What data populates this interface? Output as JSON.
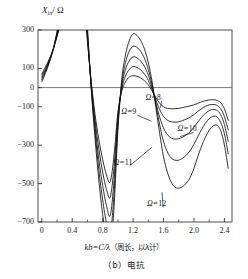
{
  "figure": {
    "caption": "（b）电抗",
    "y_axis_title": "X",
    "y_axis_sub": "in",
    "y_axis_unit": "/ Ω",
    "x_axis_title_math": "kb=C/λ",
    "x_axis_title_cn": "（周长，以λ计）"
  },
  "chart_data": {
    "type": "line",
    "title": "（b）电抗",
    "xlabel": "kb=C/λ （周长，以λ计）",
    "ylabel": "X_in / Ω",
    "xlim": [
      -0.05,
      2.5
    ],
    "ylim": [
      -700,
      300
    ],
    "xticks": [
      0,
      0.4,
      0.8,
      1.2,
      1.6,
      2.0,
      2.4
    ],
    "xtick_labels": [
      "0",
      "0.4",
      "0.8",
      "1.2",
      "1.6",
      "2.0",
      "2.4"
    ],
    "yticks": [
      300,
      100,
      0,
      -100,
      -300,
      -500,
      -700
    ],
    "ytick_labels": [
      "300",
      "100",
      "0",
      "-100",
      "-300",
      "-500",
      "-700"
    ],
    "grid": false,
    "zero_line": true,
    "legend_position": "inline-annotations",
    "series": [
      {
        "name": "Ω=8",
        "label": "Ω=8",
        "label_value": "8",
        "x": [
          0.0,
          0.05,
          0.1,
          0.15,
          0.2,
          0.25,
          0.3,
          0.35,
          0.4,
          0.45,
          0.5,
          0.55,
          0.6,
          0.65,
          0.7,
          0.75,
          0.8,
          0.85,
          0.9,
          0.95,
          1.0,
          1.05,
          1.1,
          1.15,
          1.2,
          1.25,
          1.3,
          1.35,
          1.4,
          1.45,
          1.5,
          1.55,
          1.6,
          1.65,
          1.7,
          1.75,
          1.8,
          1.85,
          1.9,
          1.95,
          2.0,
          2.05,
          2.1,
          2.15,
          2.2,
          2.25,
          2.3,
          2.35,
          2.4,
          2.45
        ],
        "y": [
          70,
          110,
          150,
          200,
          265,
          340,
          430,
          540,
          660,
          760,
          700,
          480,
          240,
          30,
          -140,
          -270,
          -375,
          -455,
          -490,
          -350,
          -130,
          -20,
          30,
          55,
          62,
          60,
          50,
          36,
          14,
          -18,
          -52,
          -82,
          -100,
          -108,
          -110,
          -110,
          -108,
          -104,
          -100,
          -95,
          -90,
          -82,
          -74,
          -68,
          -64,
          -63,
          -66,
          -78,
          -110,
          -170
        ]
      },
      {
        "name": "Ω=9",
        "label": "Ω=9",
        "label_value": "9",
        "x": [
          0.0,
          0.05,
          0.1,
          0.15,
          0.2,
          0.25,
          0.3,
          0.35,
          0.4,
          0.45,
          0.5,
          0.55,
          0.6,
          0.65,
          0.7,
          0.75,
          0.8,
          0.85,
          0.9,
          0.95,
          1.0,
          1.05,
          1.1,
          1.15,
          1.2,
          1.25,
          1.3,
          1.35,
          1.4,
          1.45,
          1.5,
          1.55,
          1.6,
          1.65,
          1.7,
          1.75,
          1.8,
          1.85,
          1.9,
          1.95,
          2.0,
          2.05,
          2.1,
          2.15,
          2.2,
          2.25,
          2.3,
          2.35,
          2.4,
          2.45
        ],
        "y": [
          60,
          100,
          145,
          200,
          270,
          355,
          455,
          580,
          720,
          830,
          760,
          520,
          255,
          20,
          -170,
          -320,
          -440,
          -530,
          -570,
          -410,
          -150,
          -10,
          60,
          95,
          110,
          105,
          92,
          70,
          38,
          -10,
          -65,
          -115,
          -150,
          -170,
          -178,
          -180,
          -178,
          -172,
          -164,
          -154,
          -140,
          -124,
          -110,
          -98,
          -90,
          -88,
          -92,
          -110,
          -150,
          -220
        ]
      },
      {
        "name": "Ω=10",
        "label": "Ω=10",
        "label_value": "10",
        "x": [
          0.0,
          0.05,
          0.1,
          0.15,
          0.2,
          0.25,
          0.3,
          0.35,
          0.4,
          0.45,
          0.5,
          0.55,
          0.6,
          0.65,
          0.7,
          0.75,
          0.8,
          0.85,
          0.9,
          0.95,
          1.0,
          1.05,
          1.1,
          1.15,
          1.2,
          1.25,
          1.3,
          1.35,
          1.4,
          1.45,
          1.5,
          1.55,
          1.6,
          1.65,
          1.7,
          1.75,
          1.8,
          1.85,
          1.9,
          1.95,
          2.0,
          2.05,
          2.1,
          2.15,
          2.2,
          2.25,
          2.3,
          2.35,
          2.4,
          2.45
        ],
        "y": [
          50,
          92,
          140,
          200,
          278,
          372,
          485,
          625,
          790,
          910,
          835,
          570,
          275,
          10,
          -200,
          -375,
          -510,
          -615,
          -665,
          -480,
          -175,
          5,
          95,
          140,
          160,
          155,
          138,
          110,
          65,
          0,
          -80,
          -155,
          -210,
          -245,
          -262,
          -268,
          -266,
          -258,
          -246,
          -230,
          -206,
          -180,
          -155,
          -134,
          -120,
          -114,
          -118,
          -140,
          -192,
          -280
        ]
      },
      {
        "name": "Ω=11",
        "label": "Ω=11",
        "label_value": "11",
        "x": [
          0.0,
          0.05,
          0.1,
          0.15,
          0.2,
          0.25,
          0.3,
          0.35,
          0.4,
          0.45,
          0.5,
          0.55,
          0.6,
          0.65,
          0.7,
          0.75,
          0.8,
          0.85,
          0.9,
          0.95,
          1.0,
          1.05,
          1.1,
          1.15,
          1.2,
          1.25,
          1.3,
          1.35,
          1.4,
          1.45,
          1.5,
          1.55,
          1.6,
          1.65,
          1.7,
          1.75,
          1.8,
          1.85,
          1.9,
          1.95,
          2.0,
          2.05,
          2.1,
          2.15,
          2.2,
          2.25,
          2.3,
          2.35,
          2.4,
          2.45
        ],
        "y": [
          40,
          85,
          136,
          200,
          286,
          390,
          515,
          670,
          855,
          990,
          910,
          620,
          295,
          0,
          -232,
          -430,
          -585,
          -705,
          -760,
          -550,
          -200,
          20,
          130,
          190,
          215,
          210,
          188,
          152,
          95,
          15,
          -90,
          -195,
          -280,
          -335,
          -366,
          -378,
          -378,
          -368,
          -352,
          -328,
          -295,
          -255,
          -218,
          -186,
          -162,
          -150,
          -152,
          -180,
          -240,
          -345
        ]
      },
      {
        "name": "Ω=12",
        "label": "Ω=12",
        "label_value": "12",
        "x": [
          0.0,
          0.05,
          0.1,
          0.15,
          0.2,
          0.25,
          0.3,
          0.35,
          0.4,
          0.45,
          0.5,
          0.55,
          0.6,
          0.65,
          0.7,
          0.75,
          0.8,
          0.85,
          0.9,
          0.95,
          1.0,
          1.05,
          1.1,
          1.15,
          1.2,
          1.25,
          1.3,
          1.35,
          1.4,
          1.45,
          1.5,
          1.55,
          1.6,
          1.65,
          1.7,
          1.75,
          1.8,
          1.85,
          1.9,
          1.95,
          2.0,
          2.05,
          2.1,
          2.15,
          2.2,
          2.25,
          2.3,
          2.35,
          2.4,
          2.45
        ],
        "y": [
          30,
          78,
          132,
          200,
          294,
          408,
          545,
          715,
          920,
          1070,
          985,
          670,
          315,
          -10,
          -265,
          -485,
          -660,
          -795,
          -855,
          -620,
          -225,
          40,
          170,
          245,
          280,
          272,
          245,
          200,
          130,
          30,
          -105,
          -240,
          -360,
          -440,
          -492,
          -518,
          -524,
          -516,
          -498,
          -468,
          -420,
          -360,
          -305,
          -258,
          -222,
          -200,
          -196,
          -222,
          -298,
          -420
        ]
      }
    ],
    "annotations": [
      {
        "text": "Ω=8",
        "x": 1.6,
        "y": -55
      },
      {
        "text": "Ω=9",
        "x": 1.28,
        "y": -128
      },
      {
        "text": "Ω=10",
        "x": 2.02,
        "y": -218
      },
      {
        "text": "Ω=11",
        "x": 1.18,
        "y": -392
      },
      {
        "text": "Ω=12",
        "x": 1.62,
        "y": -608
      }
    ]
  },
  "colors": {
    "line": "#1a1a1a",
    "axis": "#4a4a4a",
    "background": "#ffffff"
  }
}
